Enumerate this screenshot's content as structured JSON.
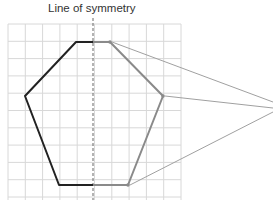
{
  "diagram": {
    "title": "Line of symmetry",
    "grid": {
      "x0": 8,
      "y0": 24,
      "cell": 17.3,
      "cols": 10,
      "rows": 11,
      "color": "#d8d8d8"
    },
    "symmetry_line": {
      "x": 93,
      "y1": 18,
      "y2": 200,
      "color": "#666666"
    },
    "left_half": {
      "points": [
        [
          93,
          42
        ],
        [
          76,
          42
        ],
        [
          25,
          96
        ],
        [
          59,
          185
        ],
        [
          93,
          185
        ]
      ],
      "color": "#222222"
    },
    "right_half": {
      "points": [
        [
          93,
          42
        ],
        [
          110,
          42
        ],
        [
          163,
          96
        ],
        [
          128,
          185
        ],
        [
          93,
          185
        ]
      ],
      "color": "#8a8a8a"
    },
    "callout": {
      "apex": [
        273,
        108
      ],
      "targets": [
        [
          112,
          42
        ],
        [
          165,
          96
        ],
        [
          130,
          185
        ]
      ],
      "apex_top": [
        273,
        102
      ],
      "apex_bottom": [
        273,
        112
      ],
      "color": "#a0a0a0"
    }
  }
}
